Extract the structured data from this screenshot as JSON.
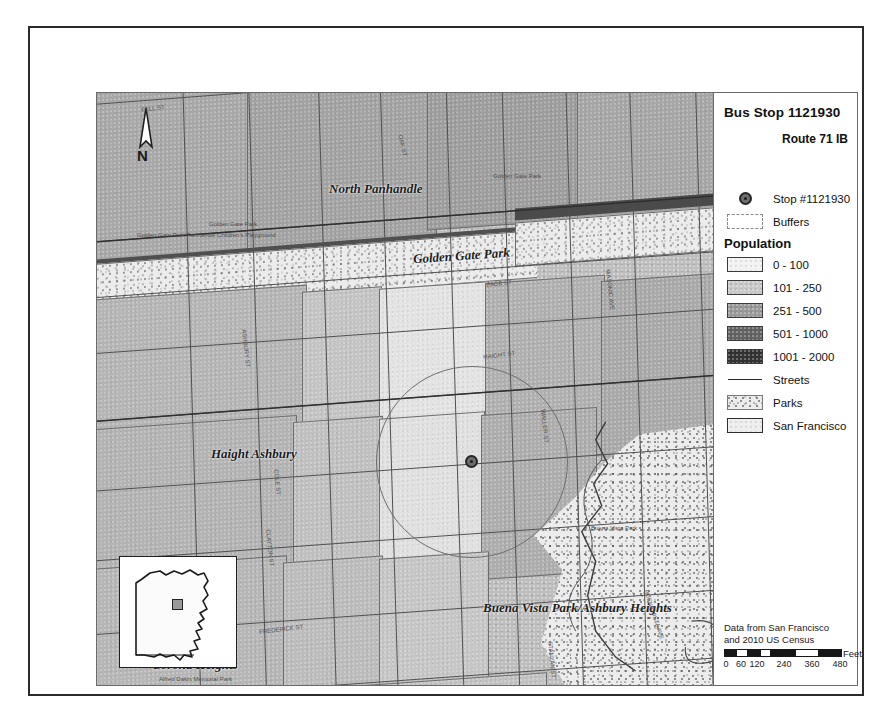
{
  "map_title": "Bus Stop 1121930",
  "legend": {
    "title": "Bus Stop 1121930",
    "subtitle": "Route 71 IB",
    "stop_label": "Stop #1121930",
    "buffers_label": "Buffers",
    "population_header": "Population",
    "population_classes": [
      {
        "label": "0 - 100",
        "color": "#f2f2f2"
      },
      {
        "label": "101 - 250",
        "color": "#c9c9c9"
      },
      {
        "label": "251 - 500",
        "color": "#9a9a9a"
      },
      {
        "label": "501 - 1000",
        "color": "#636363"
      },
      {
        "label": "1001 - 2000",
        "color": "#333333"
      }
    ],
    "streets_label": "Streets",
    "parks_label": "Parks",
    "city_label": "San Francisco"
  },
  "credits": {
    "line1": "Data from San Francisco",
    "line2": "and 2010 US Census",
    "scale_unit": "Feet",
    "scale_ticks": [
      "0",
      "60",
      "120",
      "240",
      "360",
      "480"
    ]
  },
  "north_arrow": {
    "label": "N"
  },
  "map_labels": [
    {
      "text": "North Panhandle",
      "x": 232,
      "y": 95,
      "size": 13
    },
    {
      "text": "Golden Gate Park",
      "x": 316,
      "y": 162,
      "size": 13
    },
    {
      "text": "Haight Ashbury",
      "x": 180,
      "y": 360,
      "size": 13
    },
    {
      "text": "Buena Vista Park/Ashbury Heights",
      "x": 452,
      "y": 514,
      "size": 13
    },
    {
      "text": "Corona Heights",
      "x": 121,
      "y": 572,
      "size": 13
    }
  ],
  "minor_labels": [
    {
      "text": "Golden Gate Park",
      "x": 178,
      "y": 195,
      "size": 6
    },
    {
      "text": "Golden Gate Park Panhandle Children's Playground",
      "x": 107,
      "y": 205,
      "size": 6
    },
    {
      "text": "Golden Gate Park",
      "x": 463,
      "y": 145,
      "size": 6
    },
    {
      "text": "Buena Vista Park",
      "x": 561,
      "y": 498,
      "size": 6
    },
    {
      "text": "Alfred Dakin Memorial Park",
      "x": 128,
      "y": 648,
      "size": 6
    }
  ],
  "street_labels": [
    {
      "text": "FELL ST",
      "x": 110,
      "y": 78,
      "rot": -8
    },
    {
      "text": "OAK ST",
      "x": 372,
      "y": 105,
      "rot": 76
    },
    {
      "text": "PAGE ST",
      "x": 455,
      "y": 253,
      "rot": -7
    },
    {
      "text": "ASHBURY ST",
      "x": 216,
      "y": 300,
      "rot": 84
    },
    {
      "text": "HAIGHT ST",
      "x": 452,
      "y": 325,
      "rot": -7
    },
    {
      "text": "COLE ST",
      "x": 248,
      "y": 440,
      "rot": 84
    },
    {
      "text": "MASONIC AVE",
      "x": 580,
      "y": 240,
      "rot": 84
    },
    {
      "text": "WALLER ST",
      "x": 515,
      "y": 380,
      "rot": 84
    },
    {
      "text": "CLAYTON ST",
      "x": 240,
      "y": 500,
      "rot": 84
    },
    {
      "text": "FREDERICK ST",
      "x": 228,
      "y": 600,
      "rot": -7
    },
    {
      "text": "BUENA VISTA AVE",
      "x": 618,
      "y": 560,
      "rot": 72
    },
    {
      "text": "STANYAN ST",
      "x": 522,
      "y": 612,
      "rot": 84
    }
  ],
  "stop_marker": {
    "x": 374,
    "y": 368
  },
  "buffer_circle": {
    "cx": 374,
    "cy": 368,
    "r": 95
  }
}
